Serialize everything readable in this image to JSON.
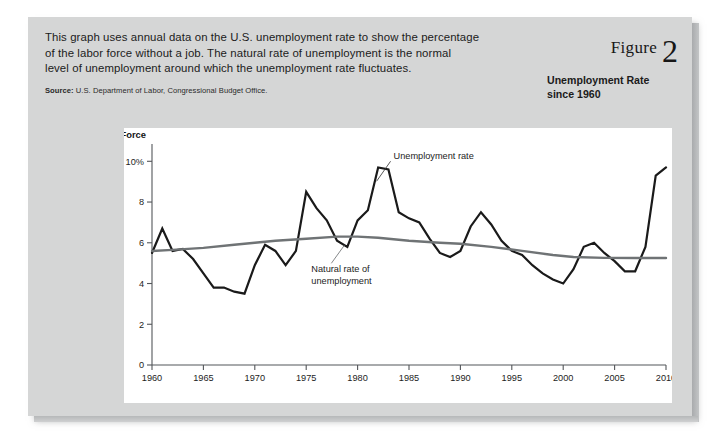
{
  "figure": {
    "figure_word": "Figure",
    "figure_number": "2",
    "title_line1": "Unemployment Rate",
    "title_line2": "since 1960",
    "intro_line1": "This graph uses annual data on the U.S. unemployment rate to show the percentage",
    "intro_line2": "of the labor force without a job. The natural rate of unemployment is the normal",
    "intro_line3": "level of unemployment around which the unemployment rate fluctuates.",
    "source_label": "Source:",
    "source_text": " U.S. Department of Labor, Congressional Budget Office."
  },
  "chart_data": {
    "type": "line",
    "title": "Unemployment Rate since 1960",
    "xlabel": "",
    "ylabel_line1": "Percent of",
    "ylabel_line2": "Labor Force",
    "xlim": [
      1960,
      2010
    ],
    "ylim": [
      0,
      10.8
    ],
    "grid": false,
    "legend_position": "inline-annotations",
    "x_ticks": [
      1960,
      1965,
      1970,
      1975,
      1980,
      1985,
      1990,
      1995,
      2000,
      2005,
      2010
    ],
    "x_tick_labels": [
      "1960",
      "1965",
      "1970",
      "1975",
      "1980",
      "1985",
      "1990",
      "1995",
      "2000",
      "2005",
      "2010"
    ],
    "y_ticks": [
      0,
      2,
      4,
      6,
      8,
      10
    ],
    "y_tick_labels": [
      "0",
      "2",
      "4",
      "6",
      "8",
      "10%"
    ],
    "annotations": [
      {
        "name": "unemployment-rate",
        "text": "Unemployment rate",
        "x": 1983.5,
        "y": 10.1
      },
      {
        "name": "natural-rate",
        "text_line1": "Natural rate of",
        "text_line2": "unemployment",
        "x": 1975.5,
        "y": 4.55
      }
    ],
    "series": [
      {
        "name": "Unemployment rate",
        "color": "#1a1a1a",
        "x": [
          1960,
          1961,
          1962,
          1963,
          1964,
          1965,
          1966,
          1967,
          1968,
          1969,
          1970,
          1971,
          1972,
          1973,
          1974,
          1975,
          1976,
          1977,
          1978,
          1979,
          1980,
          1981,
          1982,
          1983,
          1984,
          1985,
          1986,
          1987,
          1988,
          1989,
          1990,
          1991,
          1992,
          1993,
          1994,
          1995,
          1996,
          1997,
          1998,
          1999,
          2000,
          2001,
          2002,
          2003,
          2004,
          2005,
          2006,
          2007,
          2008,
          2009,
          2010
        ],
        "values": [
          5.5,
          6.7,
          5.6,
          5.7,
          5.2,
          4.5,
          3.8,
          3.8,
          3.6,
          3.5,
          4.9,
          5.9,
          5.6,
          4.9,
          5.6,
          8.5,
          7.7,
          7.1,
          6.1,
          5.8,
          7.1,
          7.6,
          9.7,
          9.6,
          7.5,
          7.2,
          7.0,
          6.2,
          5.5,
          5.3,
          5.6,
          6.8,
          7.5,
          6.9,
          6.1,
          5.6,
          5.4,
          4.9,
          4.5,
          4.2,
          4.0,
          4.7,
          5.8,
          6.0,
          5.5,
          5.1,
          4.6,
          4.6,
          5.8,
          9.3,
          9.7
        ]
      },
      {
        "name": "Natural rate of unemployment",
        "color": "#6f7375",
        "x": [
          1960,
          1962,
          1965,
          1968,
          1970,
          1972,
          1975,
          1978,
          1980,
          1982,
          1985,
          1988,
          1990,
          1993,
          1996,
          1999,
          2001,
          2004,
          2007,
          2010
        ],
        "values": [
          5.6,
          5.65,
          5.75,
          5.9,
          6.0,
          6.1,
          6.2,
          6.3,
          6.3,
          6.25,
          6.1,
          6.0,
          5.95,
          5.8,
          5.6,
          5.4,
          5.3,
          5.26,
          5.25,
          5.25
        ]
      }
    ]
  }
}
